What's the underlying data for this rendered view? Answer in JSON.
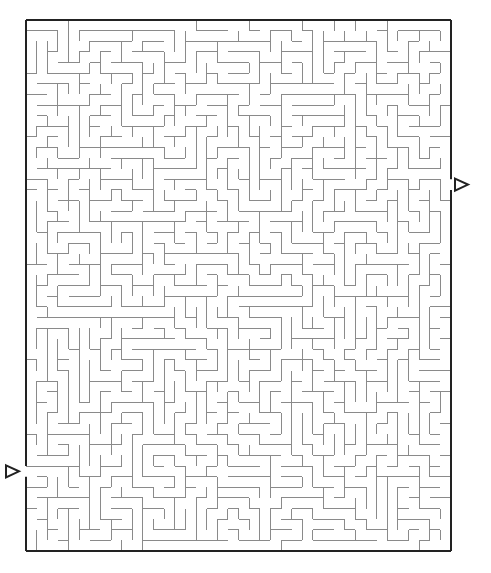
{
  "maze": {
    "cols": 40,
    "rows": 50,
    "origin": [
      26,
      20
    ],
    "width": 425,
    "height": 531,
    "seed": 73421,
    "colors": {
      "wall": "#8a8a8a",
      "border": "#222222",
      "background": "#ffffff"
    },
    "entrance": {
      "side": "left",
      "row": 42,
      "arrow_icon": "right-pointing-triangle"
    },
    "exit": {
      "side": "right",
      "row": 15,
      "arrow_icon": "right-pointing-triangle"
    }
  }
}
